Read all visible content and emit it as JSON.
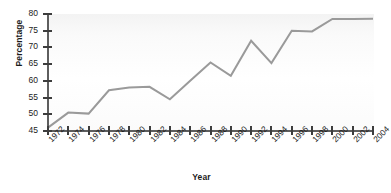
{
  "chart_data": {
    "type": "line",
    "title": "",
    "xlabel": "Year",
    "ylabel": "Percentage",
    "xlim": [
      1972,
      2004
    ],
    "ylim": [
      45,
      80
    ],
    "yticks": [
      45,
      50,
      55,
      60,
      65,
      70,
      75,
      80
    ],
    "grid": false,
    "legend": false,
    "line_color": "#9a9a9a",
    "axis_color": "#5e5e5e",
    "text_color": "#1b1b1b",
    "x": [
      1972,
      1974,
      1976,
      1978,
      1980,
      1982,
      1984,
      1986,
      1988,
      1990,
      1992,
      1994,
      1996,
      1998,
      2000,
      2002,
      2004
    ],
    "categories": [
      "1972",
      "1974",
      "1976",
      "1978",
      "1980",
      "1982",
      "1984",
      "1986",
      "1988",
      "1990",
      "1992",
      "1994",
      "1996",
      "1998",
      "2000",
      "2002",
      "2004"
    ],
    "values": [
      46.0,
      50.5,
      50.2,
      57.2,
      58.0,
      58.2,
      54.5,
      60.0,
      65.5,
      61.5,
      72.0,
      65.3,
      75.0,
      74.8,
      78.5,
      78.5,
      78.6
    ],
    "series": [
      {
        "name": "Percentage",
        "values": [
          46.0,
          50.5,
          50.2,
          57.2,
          58.0,
          58.2,
          54.5,
          60.0,
          65.5,
          61.5,
          72.0,
          65.3,
          75.0,
          74.8,
          78.5,
          78.5,
          78.6
        ]
      }
    ]
  }
}
